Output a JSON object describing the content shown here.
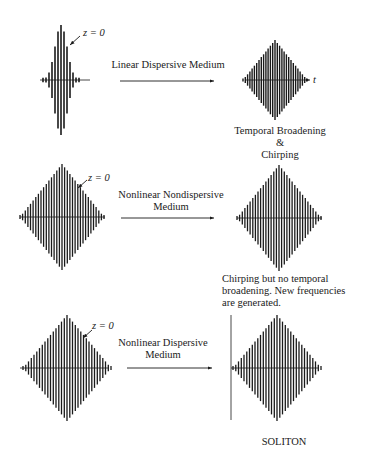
{
  "rows": [
    {
      "input_label": "z = 0",
      "medium_label_lines": [
        "Linear Dispersive Medium"
      ],
      "result_lines": [
        "Temporal Broadening",
        "&",
        "Chirping"
      ],
      "output_axis_label": "t"
    },
    {
      "input_label": "z = 0",
      "medium_label_lines": [
        "Nonlinear Nondispersive",
        "Medium"
      ],
      "result_lines": [
        "Chirping but no temporal",
        "broadening. New frequencies",
        "are generated."
      ]
    },
    {
      "input_label": "z = 0",
      "medium_label_lines": [
        "Nonlinear Dispersive",
        "Medium"
      ],
      "result_lines": [
        "SOLITON"
      ]
    }
  ],
  "colors": {
    "ink": "#1a1a1a",
    "background": "#ffffff"
  }
}
